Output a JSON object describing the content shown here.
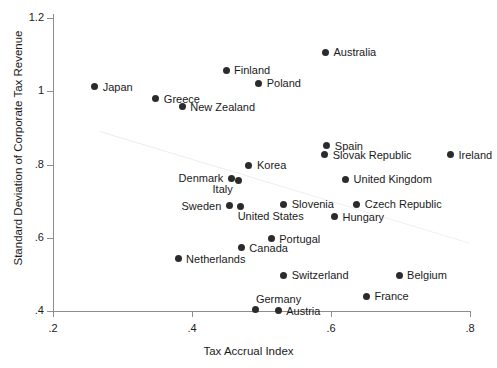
{
  "chart_data": {
    "type": "scatter",
    "title": "",
    "xlabel": "Tax Accrual Index",
    "ylabel": "Standard Deviation of Corporate Tax Revenue",
    "xlim": [
      0.2,
      0.8
    ],
    "ylim": [
      0.4,
      1.2
    ],
    "xticks": [
      ".2",
      ".4",
      ".6",
      ".8"
    ],
    "xtick_values": [
      0.2,
      0.4,
      0.6,
      0.8
    ],
    "yticks": [
      ".4",
      ".6",
      ".8",
      "1",
      "1.2"
    ],
    "ytick_values": [
      0.4,
      0.6,
      0.8,
      1.0,
      1.2
    ],
    "grid": false,
    "legend": "none",
    "marker": "filled-circle",
    "marker_color": "#2b2b2b",
    "trendline": {
      "present": true,
      "color": "#ededed",
      "x_start": 0.268,
      "y_start": 0.891,
      "x_end": 0.8,
      "y_end": 0.586
    },
    "points": [
      {
        "label": "Australia",
        "x": 0.592,
        "y": 1.106,
        "lx": 8,
        "ly": -5
      },
      {
        "label": "Finland",
        "x": 0.449,
        "y": 1.057,
        "lx": 8,
        "ly": -5
      },
      {
        "label": "Poland",
        "x": 0.496,
        "y": 1.022,
        "lx": 8,
        "ly": -5
      },
      {
        "label": "Japan",
        "x": 0.26,
        "y": 1.012,
        "lx": 8,
        "ly": -5
      },
      {
        "label": "Greece",
        "x": 0.348,
        "y": 0.979,
        "lx": 8,
        "ly": -5
      },
      {
        "label": "New Zealand",
        "x": 0.386,
        "y": 0.957,
        "lx": 8,
        "ly": -5
      },
      {
        "label": "Spain",
        "x": 0.594,
        "y": 0.851,
        "lx": 8,
        "ly": -5
      },
      {
        "label": "Slovak Republic",
        "x": 0.591,
        "y": 0.827,
        "lx": 8,
        "ly": -5
      },
      {
        "label": "Ireland",
        "x": 0.772,
        "y": 0.827,
        "lx": 8,
        "ly": -5
      },
      {
        "label": "Korea",
        "x": 0.482,
        "y": 0.798,
        "lx": 8,
        "ly": -5
      },
      {
        "label": "United Kingdom",
        "x": 0.621,
        "y": 0.76,
        "lx": 8,
        "ly": -5
      },
      {
        "label": "Denmark",
        "x": 0.457,
        "y": 0.762,
        "lx": -53,
        "ly": -5
      },
      {
        "label": "Italy",
        "x": 0.467,
        "y": 0.757,
        "lx": -26,
        "ly": 4
      },
      {
        "label": "Slovenia",
        "x": 0.532,
        "y": 0.692,
        "lx": 8,
        "ly": -5
      },
      {
        "label": "Czech Republic",
        "x": 0.637,
        "y": 0.692,
        "lx": 8,
        "ly": -5
      },
      {
        "label": "Sweden",
        "x": 0.454,
        "y": 0.688,
        "lx": -48,
        "ly": -5
      },
      {
        "label": "United States",
        "x": 0.47,
        "y": 0.685,
        "lx": -3,
        "ly": 4
      },
      {
        "label": "Hungary",
        "x": 0.605,
        "y": 0.657,
        "lx": 8,
        "ly": -5
      },
      {
        "label": "Portugal",
        "x": 0.514,
        "y": 0.597,
        "lx": 8,
        "ly": -5
      },
      {
        "label": "Canada",
        "x": 0.471,
        "y": 0.573,
        "lx": 8,
        "ly": -5
      },
      {
        "label": "Netherlands",
        "x": 0.38,
        "y": 0.543,
        "lx": 8,
        "ly": -5
      },
      {
        "label": "Switzerland",
        "x": 0.532,
        "y": 0.497,
        "lx": 8,
        "ly": -5
      },
      {
        "label": "Belgium",
        "x": 0.698,
        "y": 0.497,
        "lx": 8,
        "ly": -5
      },
      {
        "label": "France",
        "x": 0.651,
        "y": 0.44,
        "lx": 8,
        "ly": -5
      },
      {
        "label": "Germany",
        "x": 0.492,
        "y": 0.405,
        "lx": 0,
        "ly": -15
      },
      {
        "label": "Austria",
        "x": 0.524,
        "y": 0.402,
        "lx": 8,
        "ly": -4
      }
    ]
  }
}
